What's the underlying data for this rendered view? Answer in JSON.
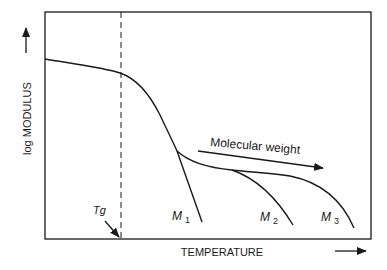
{
  "diagram": {
    "y_axis_label": "log MODULUS",
    "x_axis_label": "TEMPERATURE",
    "tg_label": "Tg",
    "molecular_weight_label": "Molecular weight",
    "curves": [
      {
        "name": "M",
        "subscript": "1"
      },
      {
        "name": "M",
        "subscript": "2"
      },
      {
        "name": "M",
        "subscript": "3"
      }
    ],
    "colors": {
      "line": "#1a1a1a",
      "background": "#ffffff"
    }
  }
}
